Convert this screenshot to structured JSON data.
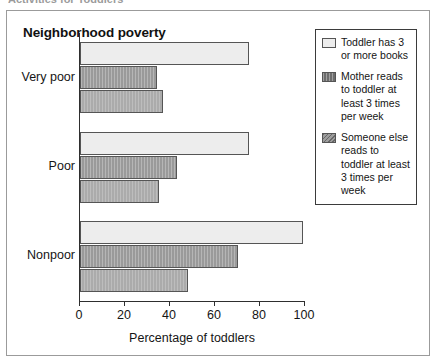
{
  "top_caption": {
    "text": "Activities for Toddlers"
  },
  "chart_data": {
    "type": "bar",
    "orientation": "horizontal",
    "title": "Neighborhood poverty",
    "xlabel": "Percentage of toddlers",
    "ylabel": "",
    "xlim": [
      0,
      100
    ],
    "xticks": [
      "0",
      "20",
      "40",
      "60",
      "80",
      "100"
    ],
    "grid": false,
    "legend_position": "top-right",
    "categories": [
      "Very poor",
      "Poor",
      "Nonpoor"
    ],
    "series": [
      {
        "name": "Toddler has 3 or more books",
        "color": "#ededed",
        "values": [
          75,
          75,
          99
        ]
      },
      {
        "name": "Mother reads to toddler at least 3 times per week",
        "color": "#9a9a9a",
        "values": [
          34,
          43,
          70
        ]
      },
      {
        "name": "Someone else reads to toddler at least 3 times per week",
        "color": "#ababab",
        "values": [
          37,
          35,
          48
        ]
      }
    ]
  },
  "legend": {
    "entries": [
      {
        "label": "Toddler has 3 or more books"
      },
      {
        "label": "Mother reads to toddler at least 3 times per week"
      },
      {
        "label": "Someone else reads to toddler at least 3 times per week"
      }
    ]
  },
  "colors": {
    "series_0": "#ededed",
    "series_1": "#9a9a9a",
    "series_2": "#ababab",
    "axis": "#2e2e2e",
    "frame": "#9b9b9b",
    "text": "#151515"
  }
}
